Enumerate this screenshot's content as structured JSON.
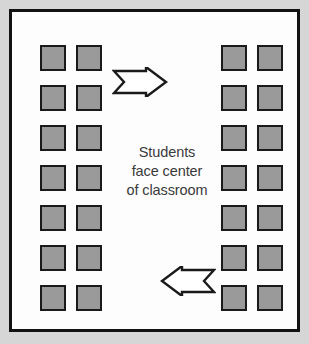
{
  "diagram": {
    "background_color": "#d6d6d6",
    "frame_color": "#121212",
    "interior_color": "#fdfdfd",
    "caption": {
      "line1": "Students",
      "line2": "face center",
      "line3": "of classroom",
      "color": "#3a3a3a"
    },
    "seat": {
      "fill_color": "#9a9a9a",
      "border_color": "#1a1a1a",
      "label": "student desk"
    },
    "seat_blocks": [
      {
        "name": "left-seat-block",
        "side": "left",
        "rows": 7,
        "columns": 2,
        "count": 14,
        "facing": "right"
      },
      {
        "name": "right-seat-block",
        "side": "right",
        "rows": 7,
        "columns": 2,
        "count": 14,
        "facing": "left"
      }
    ],
    "total_seats": 28,
    "arrows": [
      {
        "name": "arrow-pointing-right",
        "direction": "right",
        "position": "top",
        "fill_color": "#ffffff",
        "outline_color": "#1a1a1a"
      },
      {
        "name": "arrow-pointing-left",
        "direction": "left",
        "position": "bottom",
        "fill_color": "#ffffff",
        "outline_color": "#1a1a1a"
      }
    ]
  }
}
